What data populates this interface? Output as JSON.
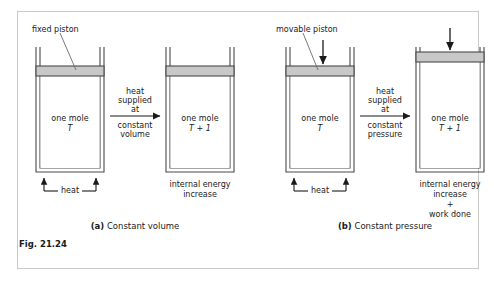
{
  "figure": {
    "number_label": "Fig. 21.24",
    "panels": [
      {
        "id": "a",
        "caption_prefix": "(a)",
        "caption_text": "Constant volume",
        "piston_label": "fixed piston",
        "process_lines": [
          "heat",
          "supplied",
          "at",
          "constant",
          "volume"
        ],
        "left_cylinder": {
          "contents_line1": "one mole",
          "contents_line2": "T",
          "bottom_label": "heat"
        },
        "right_cylinder": {
          "contents_line1": "one mole",
          "contents_line2": "T + 1",
          "result_lines": [
            "internal energy",
            "increase"
          ]
        }
      },
      {
        "id": "b",
        "caption_prefix": "(b)",
        "caption_text": "Constant pressure",
        "piston_label": "movable piston",
        "process_lines": [
          "heat",
          "supplied",
          "at",
          "constant",
          "pressure"
        ],
        "left_cylinder": {
          "contents_line1": "one mole",
          "contents_line2": "T",
          "bottom_label": "heat"
        },
        "right_cylinder": {
          "contents_line1": "one mole",
          "contents_line2": "T + 1",
          "result_lines": [
            "internal energy",
            "increase",
            "+",
            "work done"
          ]
        }
      }
    ]
  },
  "colors": {
    "frame": "#c9c9c9",
    "outline": "#4a4a4a",
    "piston_fill": "#c8c8c8",
    "text": "#1a1a1a",
    "arrow": "#1a1a1a"
  },
  "icons": {
    "process_arrow": "right-arrow-icon",
    "heat_arrow": "up-arrow-icon",
    "force_arrow": "down-arrow-icon",
    "leader_line": "leader-line-icon"
  }
}
